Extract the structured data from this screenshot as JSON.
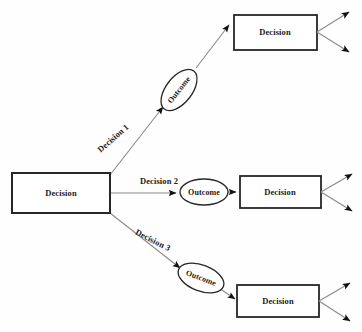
{
  "diagram": {
    "type": "decision-tree",
    "background_color": "#fefefe",
    "box_border_color": "#262626",
    "ellipse_border_color": "#262626",
    "line_color": "#8a8a8a",
    "arrowhead_color": "#111111",
    "text_color": "#1a1a1a"
  },
  "nodes": {
    "root": {
      "label": "Decision",
      "shape": "rectangle",
      "x": 12,
      "y": 173,
      "w": 98,
      "h": 40
    },
    "outcome_top": {
      "label": "Outcome",
      "shape": "ellipse",
      "cx": 179,
      "cy": 90,
      "rx": 24,
      "ry": 13,
      "rotation": -52
    },
    "outcome_mid": {
      "label": "Outcome",
      "shape": "ellipse",
      "cx": 204,
      "cy": 192,
      "rx": 24,
      "ry": 13,
      "rotation": 0
    },
    "outcome_bottom": {
      "label": "Outcome",
      "shape": "ellipse",
      "cx": 201,
      "cy": 278,
      "rx": 24,
      "ry": 13,
      "rotation": 21
    },
    "decision_top": {
      "label": "Decision",
      "shape": "rectangle",
      "x": 234,
      "y": 15,
      "w": 83,
      "h": 35
    },
    "decision_mid": {
      "label": "Decision",
      "shape": "rectangle",
      "x": 240,
      "y": 176,
      "w": 81,
      "h": 32
    },
    "decision_bottom": {
      "label": "Decision",
      "shape": "rectangle",
      "x": 237,
      "y": 285,
      "w": 82,
      "h": 32
    }
  },
  "edges": {
    "decision_1": {
      "label": "Decision 1",
      "label_x": 113,
      "label_y": 138,
      "rotation": -41
    },
    "decision_2": {
      "label": "Decision 2",
      "label_x": 159,
      "label_y": 181,
      "rotation": 0
    },
    "decision_3": {
      "label": "Decision 3",
      "label_x": 153,
      "label_y": 240,
      "rotation": 27
    }
  },
  "terminal_arrows": {
    "count_per_box": 2,
    "description": "two fan-out arrows from right edge of each terminal Decision box"
  }
}
